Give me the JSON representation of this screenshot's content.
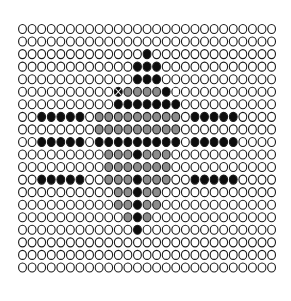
{
  "figure": {
    "background_color": "#ffffff",
    "title": "",
    "xlabel": "",
    "ylabel": ""
  },
  "marker": {
    "shape": "ellipse",
    "outline_color": "#1a1a1a",
    "outline_width": 1.1,
    "radius_x": 3.9,
    "radius_y": 4.5,
    "x_special_color": "#ffffff",
    "x_special_width": 1.1
  },
  "palette": {
    "empty": "#ffffff",
    "light_gray": "#b3b3b3",
    "mid_gray": "#8c8c8c",
    "dark_gray": "#666666",
    "black": "#0d0d0d"
  },
  "chart_data": {
    "type": "heatmap",
    "title": "",
    "subtitle": "",
    "xlabel": "",
    "ylabel": "",
    "legend": [],
    "annotations": [],
    "grid": false,
    "columns": 27,
    "rows": 20,
    "origin_x": 22.5,
    "origin_y": 29.0,
    "pitch_x": 9.58,
    "pitch_y": 12.55,
    "level_names": [
      "empty",
      "light_gray",
      "mid_gray",
      "dark_gray",
      "black"
    ],
    "level_values": [
      0,
      1,
      2,
      3,
      4
    ],
    "xlim": [
      0,
      26
    ],
    "ylim": [
      0,
      19
    ],
    "x_tick_labels": [],
    "y_tick_labels": [],
    "special_marker_cells": [
      [
        5,
        10
      ],
      [
        5,
        16
      ]
    ],
    "values": [
      [
        0,
        0,
        0,
        0,
        0,
        0,
        0,
        0,
        0,
        0,
        0,
        0,
        0,
        0,
        0,
        0,
        0,
        0,
        0,
        0,
        0,
        0,
        0,
        0,
        0,
        0,
        0
      ],
      [
        0,
        0,
        0,
        0,
        0,
        0,
        0,
        0,
        0,
        0,
        0,
        0,
        0,
        0,
        0,
        0,
        0,
        0,
        0,
        0,
        0,
        0,
        0,
        0,
        0,
        0,
        0
      ],
      [
        0,
        0,
        0,
        0,
        0,
        0,
        0,
        0,
        0,
        0,
        0,
        0,
        0,
        4,
        0,
        0,
        0,
        0,
        0,
        0,
        0,
        0,
        0,
        0,
        0,
        0,
        0
      ],
      [
        0,
        0,
        0,
        0,
        0,
        0,
        0,
        0,
        0,
        0,
        0,
        0,
        4,
        4,
        4,
        0,
        0,
        0,
        0,
        0,
        0,
        0,
        0,
        0,
        0,
        0,
        0
      ],
      [
        0,
        0,
        0,
        0,
        0,
        0,
        0,
        0,
        0,
        0,
        0,
        0,
        4,
        4,
        4,
        0,
        0,
        0,
        0,
        0,
        0,
        0,
        0,
        0,
        0,
        0,
        0
      ],
      [
        0,
        0,
        0,
        0,
        0,
        0,
        0,
        0,
        0,
        0,
        4,
        2,
        2,
        2,
        2,
        4,
        0,
        0,
        0,
        0,
        0,
        0,
        0,
        0,
        0,
        0,
        0
      ],
      [
        0,
        0,
        0,
        0,
        0,
        0,
        0,
        0,
        0,
        0,
        4,
        4,
        4,
        4,
        4,
        4,
        4,
        0,
        0,
        0,
        0,
        0,
        0,
        0,
        0,
        0,
        0
      ],
      [
        0,
        0,
        4,
        4,
        4,
        4,
        4,
        0,
        2,
        2,
        2,
        2,
        2,
        2,
        2,
        2,
        2,
        0,
        4,
        4,
        4,
        4,
        4,
        0,
        0,
        0,
        0
      ],
      [
        0,
        0,
        0,
        0,
        0,
        0,
        0,
        0,
        2,
        2,
        2,
        2,
        2,
        2,
        2,
        2,
        2,
        0,
        0,
        0,
        0,
        0,
        0,
        0,
        0,
        0,
        0
      ],
      [
        0,
        0,
        4,
        4,
        4,
        4,
        4,
        0,
        4,
        4,
        4,
        4,
        4,
        4,
        4,
        4,
        4,
        0,
        4,
        4,
        4,
        4,
        4,
        0,
        0,
        0,
        0
      ],
      [
        0,
        0,
        0,
        0,
        0,
        0,
        0,
        0,
        0,
        2,
        2,
        2,
        4,
        2,
        2,
        2,
        0,
        0,
        0,
        0,
        0,
        0,
        0,
        0,
        0,
        0,
        0
      ],
      [
        0,
        0,
        0,
        0,
        0,
        0,
        0,
        0,
        0,
        2,
        2,
        2,
        2,
        2,
        2,
        2,
        0,
        0,
        0,
        0,
        0,
        0,
        0,
        0,
        0,
        0,
        0
      ],
      [
        0,
        0,
        4,
        4,
        4,
        4,
        4,
        0,
        0,
        2,
        2,
        2,
        4,
        2,
        2,
        2,
        0,
        0,
        4,
        4,
        4,
        4,
        4,
        0,
        0,
        0,
        0
      ],
      [
        0,
        0,
        0,
        0,
        0,
        0,
        0,
        0,
        0,
        0,
        2,
        2,
        4,
        2,
        2,
        0,
        0,
        0,
        0,
        0,
        0,
        0,
        0,
        0,
        0,
        0,
        0
      ],
      [
        0,
        0,
        0,
        0,
        0,
        0,
        0,
        0,
        0,
        0,
        2,
        2,
        4,
        2,
        2,
        0,
        0,
        0,
        0,
        0,
        0,
        0,
        0,
        0,
        0,
        0,
        0
      ],
      [
        0,
        0,
        0,
        0,
        0,
        0,
        0,
        0,
        0,
        0,
        0,
        2,
        4,
        2,
        0,
        0,
        0,
        0,
        0,
        0,
        0,
        0,
        0,
        0,
        0,
        0,
        0
      ],
      [
        0,
        0,
        0,
        0,
        0,
        0,
        0,
        0,
        0,
        0,
        0,
        0,
        4,
        0,
        0,
        0,
        0,
        0,
        0,
        0,
        0,
        0,
        0,
        0,
        0,
        0,
        0
      ],
      [
        0,
        0,
        0,
        0,
        0,
        0,
        0,
        0,
        0,
        0,
        0,
        0,
        0,
        0,
        0,
        0,
        0,
        0,
        0,
        0,
        0,
        0,
        0,
        0,
        0,
        0,
        0
      ],
      [
        0,
        0,
        0,
        0,
        0,
        0,
        0,
        0,
        0,
        0,
        0,
        0,
        0,
        0,
        0,
        0,
        0,
        0,
        0,
        0,
        0,
        0,
        0,
        0,
        0,
        0,
        0
      ],
      [
        0,
        0,
        0,
        0,
        0,
        0,
        0,
        0,
        0,
        0,
        0,
        0,
        0,
        0,
        0,
        0,
        0,
        0,
        0,
        0,
        0,
        0,
        0,
        0,
        0,
        0,
        0
      ]
    ]
  }
}
